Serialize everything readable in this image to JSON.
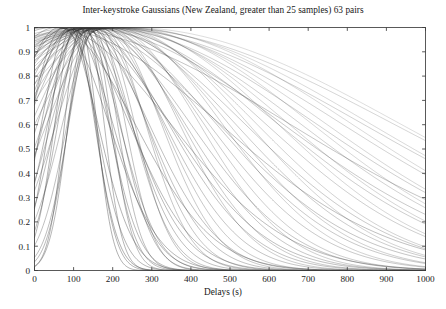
{
  "chart_data": {
    "type": "line",
    "title": "Inter-keystroke Gaussians (New Zealand, greater than 25 samples) 63 pairs",
    "xlabel": "Delays (s)",
    "ylabel": "",
    "xlim": [
      0,
      1000
    ],
    "ylim": [
      0,
      1
    ],
    "xticks": [
      0,
      100,
      200,
      300,
      400,
      500,
      600,
      700,
      800,
      900,
      1000
    ],
    "xtick_labels": [
      "0",
      "100",
      "200",
      "300",
      "400",
      "500",
      "600",
      "700",
      "800",
      "900",
      "1000"
    ],
    "yticks": [
      0,
      0.1,
      0.2,
      0.3,
      0.4,
      0.5,
      0.6,
      0.7,
      0.8,
      0.9,
      1
    ],
    "ytick_labels": [
      "0",
      "0.1",
      "0.2",
      "0.3",
      "0.4",
      "0.5",
      "0.6",
      "0.7",
      "0.8",
      "0.9",
      "1"
    ],
    "grid": false,
    "legend": "none",
    "series_count": 63,
    "curve_form": "normalized gaussian: y = exp(-0.5*((x-mean)/sigma)^2), peak = 1",
    "line_color": "#333333",
    "background_color": "#ffffff",
    "axis_color": "#3c3c3c",
    "series": [
      {
        "name": "pair-1",
        "mean": 118,
        "sigma": 41,
        "opacity": 0.62
      },
      {
        "name": "pair-2",
        "mean": 132,
        "sigma": 46,
        "opacity": 0.58
      },
      {
        "name": "pair-3",
        "mean": 104,
        "sigma": 52,
        "opacity": 0.6
      },
      {
        "name": "pair-4",
        "mean": 142,
        "sigma": 55,
        "opacity": 0.55
      },
      {
        "name": "pair-5",
        "mean": 96,
        "sigma": 58,
        "opacity": 0.64
      },
      {
        "name": "pair-6",
        "mean": 150,
        "sigma": 62,
        "opacity": 0.52
      },
      {
        "name": "pair-7",
        "mean": 126,
        "sigma": 66,
        "opacity": 0.57
      },
      {
        "name": "pair-8",
        "mean": 88,
        "sigma": 70,
        "opacity": 0.6
      },
      {
        "name": "pair-9",
        "mean": 158,
        "sigma": 74,
        "opacity": 0.5
      },
      {
        "name": "pair-10",
        "mean": 112,
        "sigma": 78,
        "opacity": 0.56
      },
      {
        "name": "pair-11",
        "mean": 136,
        "sigma": 83,
        "opacity": 0.54
      },
      {
        "name": "pair-12",
        "mean": 74,
        "sigma": 88,
        "opacity": 0.61
      },
      {
        "name": "pair-13",
        "mean": 164,
        "sigma": 92,
        "opacity": 0.48
      },
      {
        "name": "pair-14",
        "mean": 120,
        "sigma": 97,
        "opacity": 0.55
      },
      {
        "name": "pair-15",
        "mean": 146,
        "sigma": 103,
        "opacity": 0.5
      },
      {
        "name": "pair-16",
        "mean": 92,
        "sigma": 108,
        "opacity": 0.58
      },
      {
        "name": "pair-17",
        "mean": 170,
        "sigma": 114,
        "opacity": 0.46
      },
      {
        "name": "pair-18",
        "mean": 128,
        "sigma": 120,
        "opacity": 0.52
      },
      {
        "name": "pair-19",
        "mean": 64,
        "sigma": 126,
        "opacity": 0.6
      },
      {
        "name": "pair-20",
        "mean": 154,
        "sigma": 132,
        "opacity": 0.47
      },
      {
        "name": "pair-21",
        "mean": 108,
        "sigma": 139,
        "opacity": 0.54
      },
      {
        "name": "pair-22",
        "mean": 178,
        "sigma": 146,
        "opacity": 0.44
      },
      {
        "name": "pair-23",
        "mean": 134,
        "sigma": 153,
        "opacity": 0.5
      },
      {
        "name": "pair-24",
        "mean": 82,
        "sigma": 160,
        "opacity": 0.57
      },
      {
        "name": "pair-25",
        "mean": 160,
        "sigma": 168,
        "opacity": 0.45
      },
      {
        "name": "pair-26",
        "mean": 116,
        "sigma": 176,
        "opacity": 0.51
      },
      {
        "name": "pair-27",
        "mean": 186,
        "sigma": 184,
        "opacity": 0.42
      },
      {
        "name": "pair-28",
        "mean": 140,
        "sigma": 192,
        "opacity": 0.48
      },
      {
        "name": "pair-29",
        "mean": 56,
        "sigma": 200,
        "opacity": 0.58
      },
      {
        "name": "pair-30",
        "mean": 168,
        "sigma": 209,
        "opacity": 0.43
      },
      {
        "name": "pair-31",
        "mean": 124,
        "sigma": 218,
        "opacity": 0.49
      },
      {
        "name": "pair-32",
        "mean": 194,
        "sigma": 227,
        "opacity": 0.4
      },
      {
        "name": "pair-33",
        "mean": 148,
        "sigma": 236,
        "opacity": 0.46
      },
      {
        "name": "pair-34",
        "mean": 100,
        "sigma": 246,
        "opacity": 0.52
      },
      {
        "name": "pair-35",
        "mean": 176,
        "sigma": 256,
        "opacity": 0.41
      },
      {
        "name": "pair-36",
        "mean": 132,
        "sigma": 266,
        "opacity": 0.47
      },
      {
        "name": "pair-37",
        "mean": 202,
        "sigma": 277,
        "opacity": 0.38
      },
      {
        "name": "pair-38",
        "mean": 156,
        "sigma": 288,
        "opacity": 0.44
      },
      {
        "name": "pair-39",
        "mean": 48,
        "sigma": 299,
        "opacity": 0.55
      },
      {
        "name": "pair-40",
        "mean": 184,
        "sigma": 311,
        "opacity": 0.39
      },
      {
        "name": "pair-41",
        "mean": 140,
        "sigma": 323,
        "opacity": 0.45
      },
      {
        "name": "pair-42",
        "mean": 210,
        "sigma": 335,
        "opacity": 0.36
      },
      {
        "name": "pair-43",
        "mean": 164,
        "sigma": 348,
        "opacity": 0.42
      },
      {
        "name": "pair-44",
        "mean": 108,
        "sigma": 361,
        "opacity": 0.48
      },
      {
        "name": "pair-45",
        "mean": 192,
        "sigma": 374,
        "opacity": 0.37
      },
      {
        "name": "pair-46",
        "mean": 148,
        "sigma": 388,
        "opacity": 0.43
      },
      {
        "name": "pair-47",
        "mean": 218,
        "sigma": 402,
        "opacity": 0.34
      },
      {
        "name": "pair-48",
        "mean": 172,
        "sigma": 417,
        "opacity": 0.4
      },
      {
        "name": "pair-49",
        "mean": 40,
        "sigma": 432,
        "opacity": 0.52
      },
      {
        "name": "pair-50",
        "mean": 200,
        "sigma": 448,
        "opacity": 0.35
      },
      {
        "name": "pair-51",
        "mean": 156,
        "sigma": 464,
        "opacity": 0.41
      },
      {
        "name": "pair-52",
        "mean": 226,
        "sigma": 481,
        "opacity": 0.32
      },
      {
        "name": "pair-53",
        "mean": 180,
        "sigma": 498,
        "opacity": 0.38
      },
      {
        "name": "pair-54",
        "mean": 116,
        "sigma": 516,
        "opacity": 0.44
      },
      {
        "name": "pair-55",
        "mean": 208,
        "sigma": 535,
        "opacity": 0.33
      },
      {
        "name": "pair-56",
        "mean": 164,
        "sigma": 554,
        "opacity": 0.39
      },
      {
        "name": "pair-57",
        "mean": 234,
        "sigma": 574,
        "opacity": 0.3
      },
      {
        "name": "pair-58",
        "mean": 188,
        "sigma": 595,
        "opacity": 0.36
      },
      {
        "name": "pair-59",
        "mean": 32,
        "sigma": 617,
        "opacity": 0.48
      },
      {
        "name": "pair-60",
        "mean": 216,
        "sigma": 640,
        "opacity": 0.31
      },
      {
        "name": "pair-61",
        "mean": 172,
        "sigma": 664,
        "opacity": 0.37
      },
      {
        "name": "pair-62",
        "mean": 242,
        "sigma": 690,
        "opacity": 0.28
      },
      {
        "name": "pair-63",
        "mean": 196,
        "sigma": 718,
        "opacity": 0.34
      }
    ]
  },
  "figure": {
    "title": "Inter-keystroke Gaussians (New Zealand, greater than 25 samples) 63 pairs",
    "xlabel": "Delays (s)"
  }
}
